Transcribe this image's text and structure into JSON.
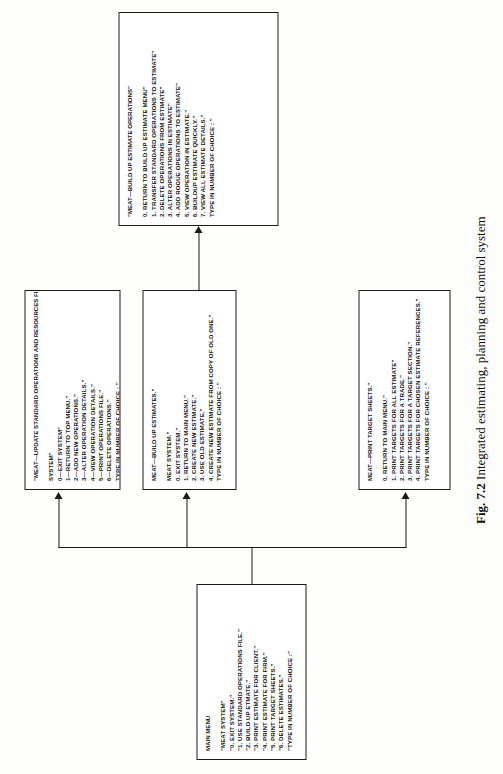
{
  "caption": {
    "figure_number": "Fig. 7.2",
    "text": "Integrated estimating, planning and control system"
  },
  "nodes": {
    "main_menu": {
      "name": "MAIN MENU",
      "title": "MAIN MENU",
      "lines": [
        "\"MEAT SYSTEM\"",
        "\"0. EXIT SYSTEM.\"",
        "\"1. USE STANDARD OPERATIONS FILE.\"",
        "\"2. BUILD UP ETMATE.\"",
        "\"3. PRINT ESTIMATE FOR CLIENT.\"",
        "\"4. PRINT ESTIMATE FOR FIRM.\"",
        "\"5. PRINT TARGET SHEETS.\"",
        "\"6. DELETE ESTIMATES.\"",
        "\"TYPE IN NUMBER OF CHOICE :\""
      ]
    },
    "update_standard_operations": {
      "title": "\"MEAT—UPDATE STANDARD OPERATIONS AND RESOURCES FILE",
      "lines": [
        "SYSTEM\"",
        "0—EXIT SYSTEM\"",
        "1—RETURN TO TOP MENU.\"",
        "2—ADD NEW OPERATIONS.\"",
        "3—ALTER OPERATION DETAILS.\"",
        "4—VIEW OPERATION DETAILS.\"",
        "5—PRINT OPERATIONS FILE.\"",
        "6—DELETE OPERATIONS.\"",
        "TYPE IN NUMBER OF CHOICE : \""
      ]
    },
    "build_up_estimates": {
      "title": "MEAT—BUILD UP ESTIMATES.\"",
      "lines": [
        "MEAT SYSTEM.\"",
        "0. EXIT SYSTEM.\"",
        "1. RETURN TO MAIN MENU.\"",
        "2. CREATE NEW ESTIMATE.\"",
        "3. USE OLD ESTIMATE.\"",
        "4. CREATE NEW ESTIMATE FROM COPY OF OLD ONE.\"",
        "TYPE IN NUMBER OF CHOICE : \""
      ]
    },
    "print_target_sheets": {
      "title": "MEAT—PRINT TARGET SHEETS.\"",
      "lines": [
        "0. RETURN TO MAIN MENU.\"",
        "1. PRINT TARGETS FOR ALL ESTIMATE\"",
        "2. PRINT TARGETS FOR A TRADE.\"",
        "3. PRINT TARGETS FOR A TARGET SECTION.\"",
        "4. PRINT TARGETS FOR CHOSEN ESTIMATE REFERENCES.\"",
        "TYPE IN NUMBER OF CHOICE : \""
      ]
    },
    "build_up_estimate_operations": {
      "title": "\"MEAT—BUILD UP ESTIMATE OPERATIONS\"",
      "lines": [
        "0. RETURN TO BUILD UP ESTIMATE MENU\"",
        "1. TRANSFER STANDARD OPERATIONS TO ESTIMATE\"",
        "2. DELETE OPERATIONS FROM ESTIMATE\"",
        "3. ALTER OPERATIONS IN ESTIMATE\"",
        "4. ADD ROGUE OPERATIONS TO ESTIMATE\"",
        "5. VIEW OPERATION IN ESTIMATE.\"",
        "6. BUILDUP ESTIMATE QUICKLY.\"",
        "7. VIEW ALL ESTIMATE DETAILS.\"",
        "TYPE IN NUMBER OF CHOICE : \""
      ]
    }
  },
  "colors": {
    "ink": "#111111",
    "paper": "#ffffff",
    "rule": "#1a1a1a"
  }
}
